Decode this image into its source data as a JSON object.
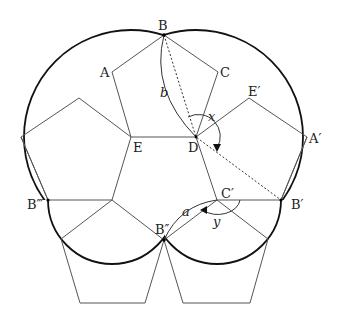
{
  "diagram": {
    "points": {
      "B": "B",
      "A": "A",
      "C": "C",
      "D": "D",
      "E": "E",
      "E_prime": "E′",
      "A_prime": "A′",
      "B_prime": "B′",
      "C_prime": "C′",
      "B_double": "B″",
      "B_triple": "B‴"
    },
    "angles": {
      "x": "x",
      "y": "y"
    },
    "arcs": {
      "a": "a",
      "b": "b"
    }
  }
}
